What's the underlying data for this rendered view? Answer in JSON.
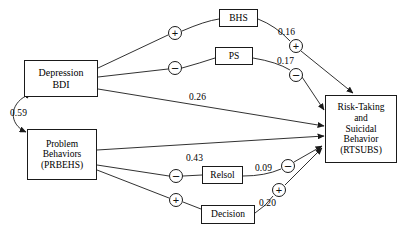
{
  "diagram": {
    "type": "path-diagram",
    "nodes": [
      {
        "id": "bdi",
        "lines": [
          "Depression",
          "BDI"
        ]
      },
      {
        "id": "prbehs",
        "lines": [
          "Problem",
          "Behaviors",
          "(PRBEHS)"
        ]
      },
      {
        "id": "bhs",
        "lines": [
          "BHS"
        ]
      },
      {
        "id": "ps",
        "lines": [
          "PS"
        ]
      },
      {
        "id": "relsol",
        "lines": [
          "Relsol"
        ]
      },
      {
        "id": "decision",
        "lines": [
          "Decision"
        ]
      },
      {
        "id": "rtsubs",
        "lines": [
          "Risk-Taking",
          "and",
          "Suicidal",
          "Behavior",
          "(RTSUBS)"
        ]
      }
    ],
    "paths": [
      {
        "id": "bdi-bhs",
        "from": "bdi",
        "to": "bhs",
        "sign": "+",
        "coefficient": ""
      },
      {
        "id": "bdi-ps",
        "from": "bdi",
        "to": "ps",
        "sign": "−",
        "coefficient": ""
      },
      {
        "id": "bdi-rtsubs",
        "from": "bdi",
        "to": "rtsubs",
        "sign": "",
        "coefficient": "0.26"
      },
      {
        "id": "bhs-rtsubs",
        "from": "bhs",
        "to": "rtsubs",
        "sign": "+",
        "coefficient": "0.16"
      },
      {
        "id": "ps-rtsubs",
        "from": "ps",
        "to": "rtsubs",
        "sign": "−",
        "coefficient": "0.17"
      },
      {
        "id": "prbehs-rtsubs",
        "from": "prbehs",
        "to": "rtsubs",
        "sign": "",
        "coefficient": "0.43"
      },
      {
        "id": "prbehs-relsol",
        "from": "prbehs",
        "to": "relsol",
        "sign": "−",
        "coefficient": ""
      },
      {
        "id": "prbehs-decision",
        "from": "prbehs",
        "to": "decision",
        "sign": "+",
        "coefficient": ""
      },
      {
        "id": "relsol-rtsubs",
        "from": "relsol",
        "to": "rtsubs",
        "sign": "−",
        "coefficient": "0.09"
      },
      {
        "id": "decision-rtsubs",
        "from": "decision",
        "to": "rtsubs",
        "sign": "+",
        "coefficient": "0.20"
      },
      {
        "id": "bdi-prbehs-correlation",
        "from": "bdi",
        "to": "prbehs",
        "sign": "",
        "coefficient": "0.59",
        "style": "double-headed-curve"
      }
    ],
    "signs": {
      "plus": "+",
      "minus": "−"
    },
    "colors": {
      "stroke": "#1a1a1a",
      "text": "#000000",
      "background": "#ffffff"
    }
  }
}
